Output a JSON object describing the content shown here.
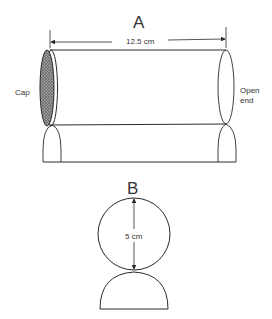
{
  "figure_a": {
    "label": "A",
    "length_label": "12.5 cm",
    "cap_label": "Cap",
    "open_end_label_line1": "Open",
    "open_end_label_line2": "end"
  },
  "figure_b": {
    "label": "B",
    "diameter_label": "5 cm"
  },
  "colors": {
    "stroke": "#2a2a2a",
    "cap_fill": "#8a8a8a",
    "text": "#333333"
  }
}
